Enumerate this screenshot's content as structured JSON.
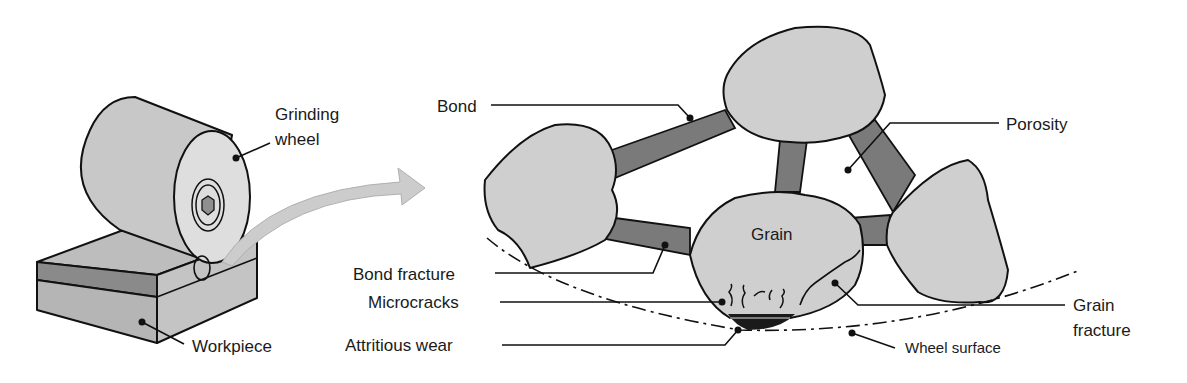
{
  "colors": {
    "grain": "#cfcfcf",
    "bond": "#7a7a7a",
    "wheel_side": "#c8c8c8",
    "wheel_face": "#dedede",
    "workpiece_top": "#bdbdbd",
    "workpiece_stripe": "#8a8a8a",
    "workpiece_side": "#b5b5b5",
    "arrow": "#cccccc",
    "outline": "#111111"
  },
  "left_panel": {
    "labels": {
      "grinding_wheel_line1": "Grinding",
      "grinding_wheel_line2": "wheel",
      "workpiece": "Workpiece"
    }
  },
  "right_panel": {
    "labels": {
      "bond": "Bond",
      "porosity": "Porosity",
      "grain": "Grain",
      "bond_fracture": "Bond fracture",
      "microcracks": "Microcracks",
      "attritious_wear": "Attritious wear",
      "grain_fracture_line1": "Grain",
      "grain_fracture_line2": "fracture",
      "wheel_surface": "Wheel surface"
    }
  }
}
